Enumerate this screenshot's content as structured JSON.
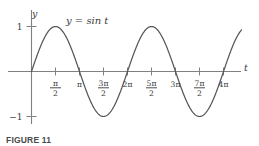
{
  "figure": {
    "caption": "FIGURE 11",
    "equation_label": "y = sin t",
    "x_axis_name": "t",
    "y_axis_name": "y"
  },
  "chart_data": {
    "type": "line",
    "title": "",
    "subtitle": "",
    "xlabel": "t",
    "ylabel": "y",
    "annotations": [
      "y = sin t"
    ],
    "legend": [
      "y = sin t"
    ],
    "legend_position": "inside-top-left",
    "grid": false,
    "axis_style": "two-axis-cross-at-origin",
    "xlim": [
      -0.35,
      13.9
    ],
    "ylim": [
      -1.35,
      1.35
    ],
    "x_tick_labels": [
      {
        "value": 1.5707963,
        "text": "pi/2",
        "numerator": "π",
        "denominator": "2",
        "kind": "fraction"
      },
      {
        "value": 3.1415927,
        "text": "pi",
        "numerator": "π",
        "denominator": "",
        "kind": "plain"
      },
      {
        "value": 4.712389,
        "text": "3pi/2",
        "numerator": "3π",
        "denominator": "2",
        "kind": "fraction"
      },
      {
        "value": 6.2831853,
        "text": "2pi",
        "numerator": "2π",
        "denominator": "",
        "kind": "plain"
      },
      {
        "value": 7.8539816,
        "text": "5pi/2",
        "numerator": "5π",
        "denominator": "2",
        "kind": "fraction"
      },
      {
        "value": 9.424778,
        "text": "3pi",
        "numerator": "3π",
        "denominator": "",
        "kind": "plain"
      },
      {
        "value": 10.9955743,
        "text": "7pi/2",
        "numerator": "7π",
        "denominator": "2",
        "kind": "fraction"
      },
      {
        "value": 12.5663706,
        "text": "4pi",
        "numerator": "4π",
        "denominator": "",
        "kind": "plain"
      }
    ],
    "y_tick_labels": [
      {
        "value": 1,
        "text": "1"
      },
      {
        "value": -1,
        "text": "−1"
      }
    ],
    "series": [
      {
        "name": "y = sin t",
        "color": "#55565a",
        "function": "sin(t)",
        "x_start": 0,
        "x_end": 13.75,
        "points": [
          {
            "x": 0.0,
            "y": 0.0
          },
          {
            "x": 0.7853982,
            "y": 0.7071
          },
          {
            "x": 1.5707963,
            "y": 1.0
          },
          {
            "x": 2.3561945,
            "y": 0.7071
          },
          {
            "x": 3.1415927,
            "y": 0.0
          },
          {
            "x": 3.9269908,
            "y": -0.7071
          },
          {
            "x": 4.712389,
            "y": -1.0
          },
          {
            "x": 5.4977871,
            "y": -0.7071
          },
          {
            "x": 6.2831853,
            "y": 0.0
          },
          {
            "x": 7.0685835,
            "y": 0.7071
          },
          {
            "x": 7.8539816,
            "y": 1.0
          },
          {
            "x": 8.6393798,
            "y": 0.7071
          },
          {
            "x": 9.424778,
            "y": 0.0
          },
          {
            "x": 10.2101761,
            "y": -0.7071
          },
          {
            "x": 10.9955743,
            "y": -1.0
          },
          {
            "x": 11.7809725,
            "y": -0.7071
          },
          {
            "x": 12.5663706,
            "y": 0.0
          },
          {
            "x": 13.3517688,
            "y": 0.7071
          },
          {
            "x": 13.75,
            "y": 0.9801
          }
        ]
      }
    ]
  },
  "colors": {
    "axis": "#808080",
    "curve": "#55565a",
    "text": "#3a3a3c",
    "background": "#ffffff"
  }
}
